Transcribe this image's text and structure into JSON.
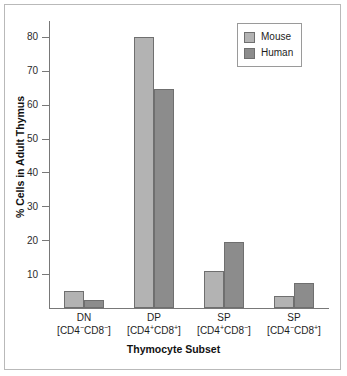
{
  "chart_data": {
    "type": "bar",
    "title": "",
    "xlabel": "Thymocyte Subset",
    "ylabel": "% Cells in Adult Thymus",
    "ylim": [
      0,
      85
    ],
    "yticks": [
      10,
      20,
      30,
      40,
      50,
      60,
      70,
      80
    ],
    "ytick_labels": [
      "10",
      "20",
      "30",
      "40",
      "50",
      "60",
      "70",
      "80"
    ],
    "grid": false,
    "legend_position": "top-right",
    "categories": [
      "DN",
      "DP",
      "SP",
      "SP"
    ],
    "category_labels": [
      {
        "abbr": "DN",
        "marker_prefix": "[CD4",
        "marker_sign1": "−",
        "marker_mid": "CD8",
        "marker_sign2": "−",
        "marker_suffix": "]"
      },
      {
        "abbr": "DP",
        "marker_prefix": "[CD4",
        "marker_sign1": "+",
        "marker_mid": "CD8",
        "marker_sign2": "+",
        "marker_suffix": "]"
      },
      {
        "abbr": "SP",
        "marker_prefix": "[CD4",
        "marker_sign1": "+",
        "marker_mid": "CD8",
        "marker_sign2": "−",
        "marker_suffix": "]"
      },
      {
        "abbr": "SP",
        "marker_prefix": "[CD4",
        "marker_sign1": "−",
        "marker_mid": "CD8",
        "marker_sign2": "+",
        "marker_suffix": "]"
      }
    ],
    "series": [
      {
        "name": "Mouse",
        "color": "#b3b3b3",
        "values": [
          5,
          80,
          11,
          3.5
        ]
      },
      {
        "name": "Human",
        "color": "#8c8c8c",
        "values": [
          2.5,
          64.5,
          19.5,
          7.5
        ]
      }
    ]
  },
  "legend": {
    "items": [
      {
        "label": "Mouse",
        "swatch": "mouse-swatch"
      },
      {
        "label": "Human",
        "swatch": "human-swatch"
      }
    ]
  }
}
